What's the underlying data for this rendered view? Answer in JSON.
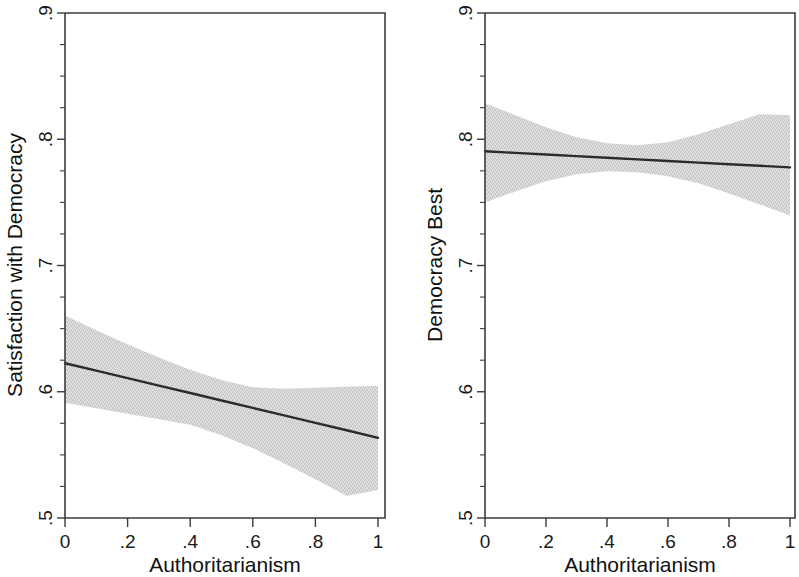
{
  "figure": {
    "background_color": "#ffffff",
    "line_color": "#2b2b2b",
    "band_color": "#dcdcdc",
    "axis_color": "#3c3c3c"
  },
  "chart_data": [
    {
      "type": "line",
      "panel_id": "left",
      "title": "",
      "xlabel": "Authoritarianism",
      "ylabel": "Satisfaction with Democracy",
      "xlim": [
        0,
        1
      ],
      "ylim": [
        0.5,
        0.9
      ],
      "xticks": [
        0,
        0.2,
        0.4,
        0.6,
        0.8,
        1
      ],
      "xticklabels": [
        "0",
        ".2",
        ".4",
        ".6",
        ".8",
        "1"
      ],
      "yticks": [
        0.5,
        0.6,
        0.7,
        0.8,
        0.9
      ],
      "yticklabels": [
        ".5",
        ".6",
        ".7",
        ".8",
        ".9"
      ],
      "grid": false,
      "legend": "none",
      "series": [
        {
          "name": "Predicted satisfaction with democracy",
          "kind": "fit-line",
          "x": [
            0,
            0.1,
            0.2,
            0.3,
            0.4,
            0.5,
            0.6,
            0.7,
            0.8,
            0.9,
            1
          ],
          "values": [
            0.6226,
            0.6167,
            0.6108,
            0.6049,
            0.599,
            0.5931,
            0.5872,
            0.5813,
            0.5754,
            0.5695,
            0.5635
          ]
        },
        {
          "name": "95% confidence interval",
          "kind": "band",
          "x": [
            0,
            0.1,
            0.2,
            0.3,
            0.4,
            0.5,
            0.6,
            0.7,
            0.8,
            0.9,
            1
          ],
          "upper": [
            0.6603,
            0.6488,
            0.6377,
            0.6272,
            0.6175,
            0.6094,
            0.6036,
            0.6024,
            0.6032,
            0.604,
            0.6048
          ],
          "lower": [
            0.5913,
            0.5869,
            0.5825,
            0.5782,
            0.5738,
            0.5655,
            0.5553,
            0.5434,
            0.5306,
            0.5175,
            0.5222
          ]
        }
      ]
    },
    {
      "type": "line",
      "panel_id": "right",
      "title": "",
      "xlabel": "Authoritarianism",
      "ylabel": "Democracy Best",
      "xlim": [
        0,
        1
      ],
      "ylim": [
        0.5,
        0.9
      ],
      "xticks": [
        0,
        0.2,
        0.4,
        0.6,
        0.8,
        1
      ],
      "xticklabels": [
        "0",
        ".2",
        ".4",
        ".6",
        ".8",
        "1"
      ],
      "yticks": [
        0.5,
        0.6,
        0.7,
        0.8,
        0.9
      ],
      "yticklabels": [
        ".5",
        ".6",
        ".7",
        ".8",
        ".9"
      ],
      "grid": false,
      "legend": "none",
      "series": [
        {
          "name": "Predicted support for democracy as best system",
          "kind": "fit-line",
          "x": [
            0,
            0.1,
            0.2,
            0.3,
            0.4,
            0.5,
            0.6,
            0.7,
            0.8,
            0.9,
            1
          ],
          "values": [
            0.7905,
            0.7892,
            0.7879,
            0.7866,
            0.7854,
            0.7841,
            0.7828,
            0.7815,
            0.7802,
            0.779,
            0.7777
          ]
        },
        {
          "name": "95% confidence interval",
          "kind": "band",
          "x": [
            0,
            0.1,
            0.2,
            0.3,
            0.4,
            0.5,
            0.6,
            0.7,
            0.8,
            0.9,
            1
          ],
          "upper": [
            0.8286,
            0.819,
            0.8095,
            0.8016,
            0.7968,
            0.7952,
            0.7976,
            0.804,
            0.8119,
            0.8198,
            0.819
          ],
          "lower": [
            0.75,
            0.7587,
            0.7667,
            0.7722,
            0.7746,
            0.7738,
            0.7706,
            0.7651,
            0.7571,
            0.7484,
            0.7397
          ]
        }
      ]
    }
  ]
}
